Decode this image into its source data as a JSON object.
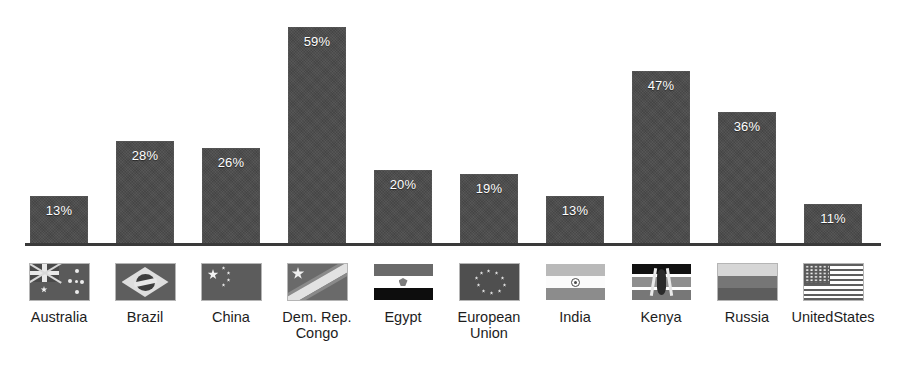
{
  "chart_data": {
    "type": "bar",
    "title": "",
    "subtitle": "",
    "xlabel": "",
    "ylabel": "",
    "ylim": [
      0,
      62
    ],
    "grid": false,
    "legend_position": "below-axis-flags",
    "value_label_position": "inside-top",
    "value_label_suffix": "%",
    "categories": [
      "Australia",
      "Brazil",
      "China",
      "Dem. Rep.\nCongo",
      "Egypt",
      "European\nUnion",
      "India",
      "Kenya",
      "Russia",
      "UnitedStates"
    ],
    "values": [
      13,
      28,
      26,
      59,
      20,
      19,
      13,
      47,
      36,
      11
    ],
    "value_labels": [
      "13%",
      "28%",
      "26%",
      "59%",
      "20%",
      "19%",
      "13%",
      "47%",
      "36%",
      "11%"
    ],
    "series": [
      {
        "name": "",
        "values": [
          13,
          28,
          26,
          59,
          20,
          19,
          13,
          47,
          36,
          11
        ]
      }
    ]
  },
  "colors": {
    "bar_fill": "#4a4a4a",
    "axis_line": "#3a3a3a",
    "value_label_text": "#ffffff",
    "category_label_text": "#1d1d1d",
    "background": "#ffffff"
  },
  "legend": {
    "items": [
      {
        "label": "Australia",
        "flag": "flag-australia-icon"
      },
      {
        "label": "Brazil",
        "flag": "flag-brazil-icon"
      },
      {
        "label": "China",
        "flag": "flag-china-icon"
      },
      {
        "label": "Dem. Rep.\nCongo",
        "flag": "flag-dr-congo-icon"
      },
      {
        "label": "Egypt",
        "flag": "flag-egypt-icon"
      },
      {
        "label": "European\nUnion",
        "flag": "flag-european-union-icon"
      },
      {
        "label": "India",
        "flag": "flag-india-icon"
      },
      {
        "label": "Kenya",
        "flag": "flag-kenya-icon"
      },
      {
        "label": "Russia",
        "flag": "flag-russia-icon"
      },
      {
        "label": "UnitedStates",
        "flag": "flag-united-states-icon"
      }
    ]
  }
}
